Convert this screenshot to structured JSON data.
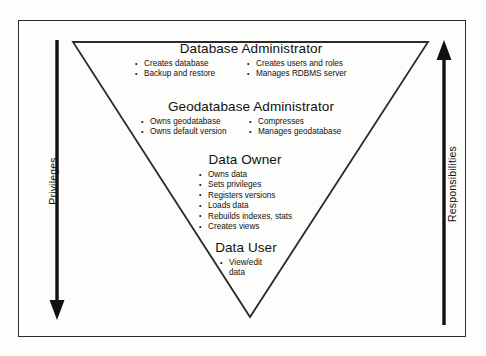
{
  "diagram": {
    "shape": "inverted-triangle",
    "line_color": "#2b2b2b",
    "background_color": "#fdfdfb",
    "axes": {
      "left": {
        "label": "Privileges",
        "direction": "down",
        "arrow_icon": "arrow-down-icon"
      },
      "right": {
        "label": "Responsibilities",
        "direction": "up",
        "arrow_icon": "arrow-up-icon"
      }
    },
    "sections": [
      {
        "id": "database-administrator",
        "title": "Database Administrator",
        "columns": [
          [
            "Creates database",
            "Backup and restore"
          ],
          [
            "Creates users and roles",
            "Manages RDBMS server"
          ]
        ]
      },
      {
        "id": "geodatabase-administrator",
        "title": "Geodatabase Administrator",
        "columns": [
          [
            "Owns geodatabase",
            "Owns default version"
          ],
          [
            "Compresses",
            "Manages geodatabase"
          ]
        ]
      },
      {
        "id": "data-owner",
        "title": "Data Owner",
        "columns": [
          [
            "Owns data",
            "Sets privileges",
            "Registers versions",
            "Loads data",
            "Rebuilds indexes, stats",
            "Creates views"
          ]
        ]
      },
      {
        "id": "data-user",
        "title": "Data User",
        "columns": [
          [
            "View/edit data"
          ]
        ]
      }
    ]
  }
}
